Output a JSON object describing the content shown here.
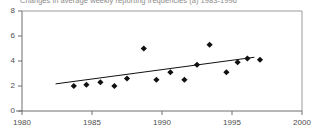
{
  "chart_data": {
    "type": "scatter",
    "title": "Changes in average weekly reporting frequencies (a) 1983-1996",
    "xlabel": "",
    "ylabel": "",
    "xlim": [
      1980,
      2000
    ],
    "ylim": [
      0,
      8
    ],
    "xticks": [
      1980,
      1985,
      1990,
      1995,
      2000
    ],
    "yticks": [
      0,
      2,
      4,
      6,
      8
    ],
    "xtick_labels": [
      "1980",
      "1985",
      "1990",
      "1995",
      "2000"
    ],
    "ytick_labels": [
      "0",
      "2",
      "4",
      "6",
      "8"
    ],
    "grid": false,
    "legend": null,
    "marker": "diamond",
    "marker_color": "#111111",
    "series": [
      {
        "name": "Average weekly reporting frequency",
        "x": [
          1983.7,
          1984.6,
          1985.6,
          1986.6,
          1987.5,
          1988.7,
          1989.6,
          1990.6,
          1991.6,
          1992.5,
          1993.4,
          1994.6,
          1995.4,
          1996.1,
          1997.0
        ],
        "y": [
          2.0,
          2.1,
          2.3,
          2.0,
          2.6,
          5.0,
          2.5,
          3.1,
          2.5,
          3.7,
          5.3,
          3.1,
          3.9,
          4.2,
          4.1
        ]
      }
    ],
    "trendline": {
      "name": "Linear trend",
      "color": "#111111",
      "x": [
        1982.4,
        1996.6
      ],
      "y": [
        2.17,
        4.3
      ]
    }
  }
}
